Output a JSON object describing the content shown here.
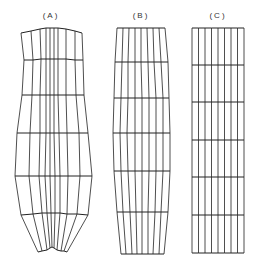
{
  "figure": {
    "panels": [
      {
        "id": "A",
        "label": "(A)",
        "label_x": 51,
        "description": "distorted mesh, bulging at middle, converging at bottom",
        "rows": [
          [
            [
              21,
              33
            ],
            [
              31,
              31
            ],
            [
              40,
              29
            ],
            [
              46,
              28
            ],
            [
              50,
              28
            ],
            [
              54,
              28
            ],
            [
              58,
              28
            ],
            [
              66,
              29
            ],
            [
              75,
              31
            ],
            [
              82,
              33
            ]
          ],
          [
            [
              24,
              60
            ],
            [
              33,
              60
            ],
            [
              41,
              59
            ],
            [
              46,
              59
            ],
            [
              50,
              59
            ],
            [
              54,
              59
            ],
            [
              58,
              59
            ],
            [
              66,
              59
            ],
            [
              75,
              60
            ],
            [
              83,
              60
            ]
          ],
          [
            [
              22,
              95
            ],
            [
              32,
              95
            ],
            [
              40,
              95
            ],
            [
              46,
              95
            ],
            [
              50,
              95
            ],
            [
              54,
              95
            ],
            [
              58,
              95
            ],
            [
              66,
              95
            ],
            [
              76,
              95
            ],
            [
              84,
              95
            ]
          ],
          [
            [
              17,
              133
            ],
            [
              30,
              133
            ],
            [
              40,
              133
            ],
            [
              46,
              133
            ],
            [
              50,
              133
            ],
            [
              54,
              133
            ],
            [
              59,
              133
            ],
            [
              67,
              133
            ],
            [
              79,
              133
            ],
            [
              88,
              133
            ]
          ],
          [
            [
              15,
              176
            ],
            [
              29,
              176
            ],
            [
              39,
              176
            ],
            [
              45,
              176
            ],
            [
              50,
              176
            ],
            [
              55,
              176
            ],
            [
              60,
              176
            ],
            [
              68,
              176
            ],
            [
              80,
              176
            ],
            [
              92,
              176
            ]
          ],
          [
            [
              21,
              215
            ],
            [
              33,
              214
            ],
            [
              42,
              213
            ],
            [
              47,
              213
            ],
            [
              51,
              213
            ],
            [
              55,
              213
            ],
            [
              60,
              213
            ],
            [
              67,
              214
            ],
            [
              77,
              214
            ],
            [
              88,
              215
            ]
          ],
          [
            [
              38,
              252
            ],
            [
              42,
              251
            ],
            [
              47,
              250
            ],
            [
              50,
              248
            ],
            [
              52,
              247
            ],
            [
              54,
              248
            ],
            [
              57,
              250
            ],
            [
              61,
              251
            ],
            [
              64,
              251
            ],
            [
              67,
              252
            ]
          ]
        ]
      },
      {
        "id": "B",
        "label": "(B)",
        "label_x": 141,
        "description": "tapered mesh, slight barrel shape",
        "rows": [
          [
            [
              117,
              28
            ],
            [
              123,
              28
            ],
            [
              129,
              28
            ],
            [
              135,
              28
            ],
            [
              141,
              28
            ],
            [
              147,
              28
            ],
            [
              153,
              28
            ],
            [
              159,
              28
            ],
            [
              165,
              28
            ]
          ],
          [
            [
              115,
              62
            ],
            [
              122,
              62
            ],
            [
              128,
              62
            ],
            [
              135,
              62
            ],
            [
              141,
              62
            ],
            [
              148,
              62
            ],
            [
              154,
              62
            ],
            [
              161,
              62
            ],
            [
              168,
              62
            ]
          ],
          [
            [
              114,
              98
            ],
            [
              121,
              98
            ],
            [
              128,
              98
            ],
            [
              135,
              98
            ],
            [
              142,
              98
            ],
            [
              149,
              98
            ],
            [
              156,
              98
            ],
            [
              163,
              98
            ],
            [
              169,
              98
            ]
          ],
          [
            [
              113,
              133
            ],
            [
              120,
              133
            ],
            [
              127,
              133
            ],
            [
              135,
              133
            ],
            [
              142,
              133
            ],
            [
              149,
              133
            ],
            [
              156,
              133
            ],
            [
              163,
              133
            ],
            [
              170,
              133
            ]
          ],
          [
            [
              114,
              171
            ],
            [
              121,
              171
            ],
            [
              128,
              171
            ],
            [
              135,
              171
            ],
            [
              142,
              171
            ],
            [
              149,
              171
            ],
            [
              156,
              171
            ],
            [
              163,
              171
            ],
            [
              170,
              171
            ]
          ],
          [
            [
              117,
              212
            ],
            [
              123,
              212
            ],
            [
              130,
              212
            ],
            [
              136,
              212
            ],
            [
              142,
              212
            ],
            [
              148,
              212
            ],
            [
              155,
              212
            ],
            [
              161,
              212
            ],
            [
              168,
              212
            ]
          ],
          [
            [
              121,
              254
            ],
            [
              126,
              254
            ],
            [
              132,
              254
            ],
            [
              137,
              254
            ],
            [
              142,
              254
            ],
            [
              148,
              254
            ],
            [
              153,
              254
            ],
            [
              159,
              254
            ],
            [
              164,
              254
            ]
          ]
        ]
      },
      {
        "id": "C",
        "label": "(C)",
        "label_x": 218,
        "description": "undeformed rectangular mesh",
        "rows": [
          [
            [
              192,
              28
            ],
            [
              198.5,
              28
            ],
            [
              205,
              28
            ],
            [
              211.5,
              28
            ],
            [
              218,
              28
            ],
            [
              224.5,
              28
            ],
            [
              231,
              28
            ],
            [
              237.5,
              28
            ],
            [
              244,
              28
            ]
          ],
          [
            [
              192,
              65
            ],
            [
              198.5,
              65
            ],
            [
              205,
              65
            ],
            [
              211.5,
              65
            ],
            [
              218,
              65
            ],
            [
              224.5,
              65
            ],
            [
              231,
              65
            ],
            [
              237.5,
              65
            ],
            [
              244,
              65
            ]
          ],
          [
            [
              192,
              102
            ],
            [
              198.5,
              102
            ],
            [
              205,
              102
            ],
            [
              211.5,
              102
            ],
            [
              218,
              102
            ],
            [
              224.5,
              102
            ],
            [
              231,
              102
            ],
            [
              237.5,
              102
            ],
            [
              244,
              102
            ]
          ],
          [
            [
              192,
              140
            ],
            [
              198.5,
              140
            ],
            [
              205,
              140
            ],
            [
              211.5,
              140
            ],
            [
              218,
              140
            ],
            [
              224.5,
              140
            ],
            [
              231,
              140
            ],
            [
              237.5,
              140
            ],
            [
              244,
              140
            ]
          ],
          [
            [
              192,
              177
            ],
            [
              198.5,
              177
            ],
            [
              205,
              177
            ],
            [
              211.5,
              177
            ],
            [
              218,
              177
            ],
            [
              224.5,
              177
            ],
            [
              231,
              177
            ],
            [
              237.5,
              177
            ],
            [
              244,
              177
            ]
          ],
          [
            [
              192,
              215
            ],
            [
              198.5,
              215
            ],
            [
              205,
              215
            ],
            [
              211.5,
              215
            ],
            [
              218,
              215
            ],
            [
              224.5,
              215
            ],
            [
              231,
              215
            ],
            [
              237.5,
              215
            ],
            [
              244,
              215
            ]
          ],
          [
            [
              192,
              253
            ],
            [
              198.5,
              253
            ],
            [
              205,
              253
            ],
            [
              211.5,
              253
            ],
            [
              218,
              253
            ],
            [
              224.5,
              253
            ],
            [
              231,
              253
            ],
            [
              237.5,
              253
            ],
            [
              244,
              253
            ]
          ]
        ]
      }
    ],
    "stroke_color": "#222222",
    "background": "#ffffff"
  }
}
